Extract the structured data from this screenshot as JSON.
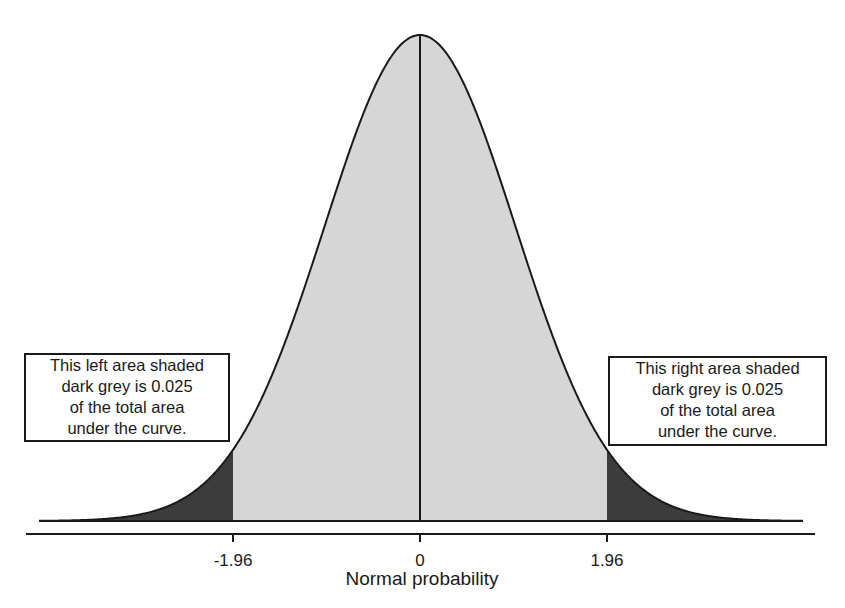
{
  "chart_data": {
    "type": "area",
    "title": "",
    "xlabel": "Normal probability",
    "ylabel": "",
    "distribution": "standard normal",
    "mean": 0,
    "sd": 1,
    "x_range": [
      -4,
      4
    ],
    "ticks": [
      {
        "value": -1.96,
        "label": "-1.96"
      },
      {
        "value": 0,
        "label": "0"
      },
      {
        "value": 1.96,
        "label": "1.96"
      }
    ],
    "regions": [
      {
        "name": "left tail",
        "from": -4,
        "to": -1.96,
        "fill": "#3c3c3c",
        "area": 0.025
      },
      {
        "name": "central",
        "from": -1.96,
        "to": 1.96,
        "fill": "#d6d6d6",
        "area": 0.95
      },
      {
        "name": "right tail",
        "from": 1.96,
        "to": 4,
        "fill": "#3c3c3c",
        "area": 0.025
      }
    ],
    "annotations": [
      {
        "position": "left",
        "lines": [
          "This left area shaded",
          "dark grey is 0.025",
          "of the total area",
          "under the curve."
        ]
      },
      {
        "position": "right",
        "lines": [
          "This right area shaded",
          "dark grey is 0.025",
          "of the total area",
          "under the curve."
        ]
      }
    ],
    "mean_line": true,
    "grid": false,
    "legend": null
  },
  "axis": {
    "ticks": [
      "-1.96",
      "0",
      "1.96"
    ],
    "title": "Normal probability"
  },
  "notes": {
    "left": [
      "This left area shaded",
      "dark grey is 0.025",
      "of the total area",
      "under the curve."
    ],
    "right": [
      "This right area shaded",
      "dark grey is 0.025",
      "of the total area",
      "under the curve."
    ]
  },
  "colors": {
    "tail_fill": "#3c3c3c",
    "center_fill": "#d6d6d6",
    "line": "#1a1a1a",
    "background": "#ffffff"
  }
}
